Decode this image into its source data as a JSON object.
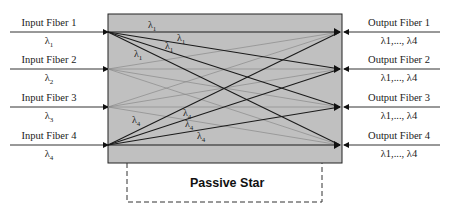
{
  "diagram": {
    "title": "Passive Star",
    "inputs": [
      {
        "label": "Input Fiber 1",
        "wavelength": "λ",
        "sub": "1"
      },
      {
        "label": "Input Fiber 2",
        "wavelength": "λ",
        "sub": "2"
      },
      {
        "label": "Input Fiber 3",
        "wavelength": "λ",
        "sub": "3"
      },
      {
        "label": "Input Fiber 4",
        "wavelength": "λ",
        "sub": "4"
      }
    ],
    "outputs": [
      {
        "label": "Output Fiber 1",
        "wavelengths": "λ1,..., λ4"
      },
      {
        "label": "Output Fiber 2",
        "wavelengths": "λ1,..., λ4"
      },
      {
        "label": "Output Fiber 3",
        "wavelengths": "λ1,..., λ4"
      },
      {
        "label": "Output Fiber 4",
        "wavelengths": "λ1,..., λ4"
      }
    ],
    "inner_labels": {
      "l1": "λ",
      "l1_sub": "1",
      "l4": "λ",
      "l4_sub": "4"
    },
    "colors": {
      "box_fill": "#c0c0c0",
      "line_dark": "#1a1a1a",
      "line_light": "#8a8a8a"
    }
  }
}
